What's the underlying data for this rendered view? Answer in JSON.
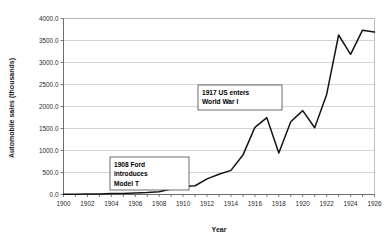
{
  "chart_data": {
    "type": "line",
    "title": "",
    "xlabel": "Year",
    "ylabel": "Automobile sales (thousands)",
    "xlim": [
      1900,
      1926
    ],
    "ylim": [
      0,
      4000
    ],
    "grid": true,
    "legend": "none",
    "x_tick_labels": [
      "1900",
      "1902",
      "1904",
      "1906",
      "1908",
      "1910",
      "1912",
      "1914",
      "1916",
      "1918",
      "1920",
      "1922",
      "1924",
      "1926"
    ],
    "y_tick_labels": [
      "0.0",
      "500.0",
      "1000.0",
      "1500.0",
      "2000.0",
      "2500.0",
      "3000.0",
      "3500.0",
      "4000.0"
    ],
    "y_tick_values": [
      0,
      500,
      1000,
      1500,
      2000,
      2500,
      3000,
      3500,
      4000
    ],
    "x": [
      1900,
      1901,
      1902,
      1903,
      1904,
      1905,
      1906,
      1907,
      1908,
      1909,
      1910,
      1911,
      1912,
      1913,
      1914,
      1915,
      1916,
      1917,
      1918,
      1919,
      1920,
      1921,
      1922,
      1923,
      1924,
      1925,
      1926
    ],
    "series": [
      {
        "name": "Automobile sales",
        "color": "#141414",
        "values": [
          4,
          7,
          9,
          11,
          22,
          24,
          33,
          43,
          64,
          124,
          181,
          199,
          356,
          461,
          548,
          896,
          1526,
          1746,
          943,
          1652,
          1906,
          1518,
          2274,
          3625,
          3186,
          3735,
          3692
        ]
      }
    ],
    "annotations": [
      {
        "id": "model-t",
        "lines": [
          "1908 Ford",
          "introduces",
          "Model T"
        ],
        "box_x": 110,
        "box_y": 157,
        "box_w": 79,
        "box_h": 33
      },
      {
        "id": "world-war-one",
        "lines": [
          "1917 US enters",
          "World War I"
        ],
        "box_x": 198,
        "box_y": 85,
        "box_w": 84,
        "box_h": 25
      }
    ]
  },
  "axes": {
    "x_axis_label": "Year",
    "y_axis_label": "Automobile sales (thousands)"
  }
}
